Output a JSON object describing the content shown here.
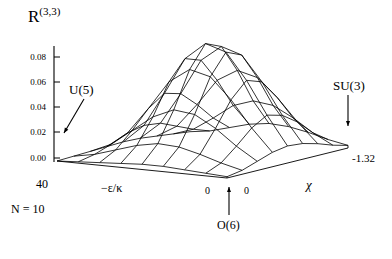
{
  "figure": {
    "title": "R",
    "title_superscript": "(3,3)",
    "background_color": "#ffffff",
    "line_color": "#000000",
    "annotation_note": "N = 10"
  },
  "labels": {
    "u5": "U(5)",
    "su3": "SU(3)",
    "o6": "O(6)",
    "chi_axis": "χ",
    "eps_axis": "−ε/κ",
    "eps_max": "40",
    "chi_min": "-1.32",
    "zero_left": "0",
    "zero_right": "0",
    "n_value": "N = 10"
  },
  "chart_data": {
    "type": "surface",
    "title": "R(3,3)",
    "subtitle": "",
    "xlabel": "−ε/κ",
    "ylabel": "χ",
    "zlabel": "R^(3,3)",
    "zlim": [
      0.0,
      0.09
    ],
    "ztick_labels": [
      "0.08",
      "0.06",
      "0.04",
      "0.02",
      "0.00"
    ],
    "ztick_values": [
      0.08,
      0.06,
      0.04,
      0.02,
      0.0
    ],
    "xlim": [
      0,
      40
    ],
    "xtick_labels": [
      "40",
      "0"
    ],
    "ylim": [
      0,
      -1.32
    ],
    "ytick_labels": [
      "0",
      "-1.32"
    ],
    "grid": false,
    "legend": "none",
    "annotations": [
      {
        "text": "U(5)",
        "arrow": "down-left",
        "points_to": "origin corner (ε/κ=40, χ=0)"
      },
      {
        "text": "SU(3)",
        "arrow": "down",
        "points_to": "right corner (χ=-1.32)"
      },
      {
        "text": "O(6)",
        "arrow": "up",
        "points_to": "front corner (ε/κ=0, χ=0)"
      },
      {
        "text": "N = 10",
        "arrow": "none",
        "points_to": "figure caption"
      }
    ],
    "mesh": {
      "nx": 9,
      "ny": 9,
      "description": "Single-peaked wireframe surface rising from near-zero at all base edges to a maximum of about 0.085 near the center-rear of the domain.",
      "x": [
        0,
        5,
        10,
        15,
        20,
        25,
        30,
        35,
        40
      ],
      "y": [
        0,
        -0.165,
        -0.33,
        -0.495,
        -0.66,
        -0.825,
        -0.99,
        -1.155,
        -1.32
      ],
      "z": [
        [
          0.0,
          0.001,
          0.002,
          0.003,
          0.004,
          0.004,
          0.003,
          0.002,
          0.001
        ],
        [
          0.001,
          0.004,
          0.009,
          0.014,
          0.017,
          0.016,
          0.012,
          0.007,
          0.003
        ],
        [
          0.002,
          0.009,
          0.021,
          0.033,
          0.04,
          0.038,
          0.029,
          0.017,
          0.007
        ],
        [
          0.003,
          0.015,
          0.035,
          0.057,
          0.068,
          0.064,
          0.048,
          0.028,
          0.011
        ],
        [
          0.004,
          0.018,
          0.044,
          0.072,
          0.085,
          0.08,
          0.06,
          0.035,
          0.013
        ],
        [
          0.004,
          0.017,
          0.041,
          0.068,
          0.08,
          0.075,
          0.056,
          0.032,
          0.012
        ],
        [
          0.003,
          0.012,
          0.03,
          0.05,
          0.059,
          0.055,
          0.041,
          0.024,
          0.009
        ],
        [
          0.002,
          0.007,
          0.017,
          0.028,
          0.033,
          0.031,
          0.023,
          0.013,
          0.005
        ],
        [
          0.001,
          0.003,
          0.007,
          0.011,
          0.013,
          0.012,
          0.009,
          0.005,
          0.002
        ]
      ]
    }
  }
}
